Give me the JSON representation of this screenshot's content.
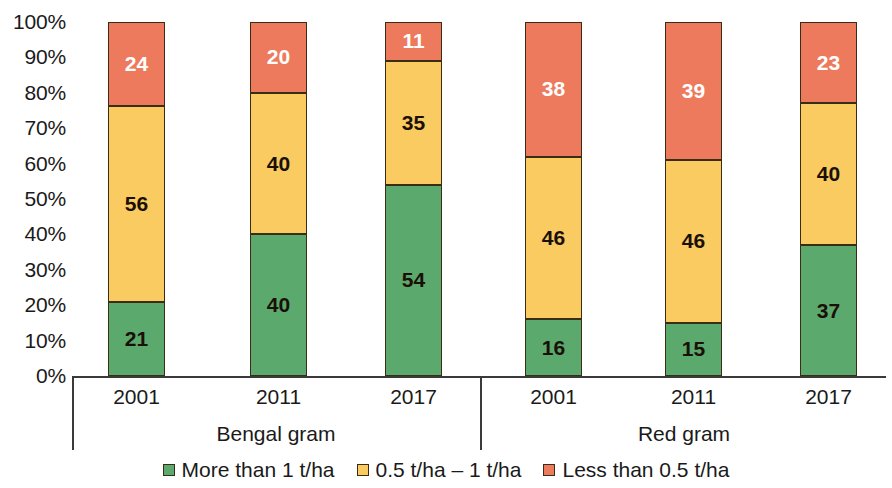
{
  "chart_data": {
    "type": "bar",
    "subtype": "stacked-percentage",
    "title": "",
    "xlabel": "",
    "ylabel": "",
    "ylim": [
      0,
      100
    ],
    "y_tick_labels": [
      "100%",
      "90%",
      "80%",
      "70%",
      "60%",
      "50%",
      "40%",
      "30%",
      "20%",
      "10%",
      "0%"
    ],
    "y_tick_values": [
      100,
      90,
      80,
      70,
      60,
      50,
      40,
      30,
      20,
      10,
      0
    ],
    "grid": false,
    "legend_position": "bottom-center",
    "categories": [
      "2001",
      "2011",
      "2017",
      "2001",
      "2011",
      "2017"
    ],
    "groups": [
      {
        "label": "Bengal gram",
        "categories": [
          "2001",
          "2011",
          "2017"
        ]
      },
      {
        "label": "Red gram",
        "categories": [
          "2001",
          "2011",
          "2017"
        ]
      }
    ],
    "series": [
      {
        "name": "More than 1 t/ha",
        "color": "#5BA96C",
        "values": [
          21,
          40,
          54,
          16,
          15,
          37
        ]
      },
      {
        "name": "0.5 t/ha – 1 t/ha",
        "color": "#F9CB60",
        "values": [
          56,
          40,
          35,
          46,
          46,
          40
        ]
      },
      {
        "name": "Less than 0.5 t/ha",
        "color": "#ED7A5C",
        "values": [
          24,
          20,
          11,
          38,
          39,
          23
        ]
      }
    ],
    "bars": [
      {
        "group": "Bengal gram",
        "category": "2001",
        "segments": [
          {
            "series": "More than 1 t/ha",
            "value": 21,
            "label": "21",
            "color": "#5BA96C",
            "text_color": "#1a1008"
          },
          {
            "series": "0.5 t/ha – 1 t/ha",
            "value": 56,
            "label": "56",
            "color": "#F9CB60",
            "text_color": "#1a1008"
          },
          {
            "series": "Less than 0.5 t/ha",
            "value": 24,
            "label": "24",
            "color": "#ED7A5C",
            "text_color": "#ffffff"
          }
        ]
      },
      {
        "group": "Bengal gram",
        "category": "2011",
        "segments": [
          {
            "series": "More than 1 t/ha",
            "value": 40,
            "label": "40",
            "color": "#5BA96C",
            "text_color": "#1a1008"
          },
          {
            "series": "0.5 t/ha – 1 t/ha",
            "value": 40,
            "label": "40",
            "color": "#F9CB60",
            "text_color": "#1a1008"
          },
          {
            "series": "Less than 0.5 t/ha",
            "value": 20,
            "label": "20",
            "color": "#ED7A5C",
            "text_color": "#ffffff"
          }
        ]
      },
      {
        "group": "Bengal gram",
        "category": "2017",
        "segments": [
          {
            "series": "More than 1 t/ha",
            "value": 54,
            "label": "54",
            "color": "#5BA96C",
            "text_color": "#1a1008"
          },
          {
            "series": "0.5 t/ha – 1 t/ha",
            "value": 35,
            "label": "35",
            "color": "#F9CB60",
            "text_color": "#1a1008"
          },
          {
            "series": "Less than 0.5 t/ha",
            "value": 11,
            "label": "11",
            "color": "#ED7A5C",
            "text_color": "#ffffff"
          }
        ]
      },
      {
        "group": "Red gram",
        "category": "2001",
        "segments": [
          {
            "series": "More than 1 t/ha",
            "value": 16,
            "label": "16",
            "color": "#5BA96C",
            "text_color": "#1a1008"
          },
          {
            "series": "0.5 t/ha – 1 t/ha",
            "value": 46,
            "label": "46",
            "color": "#F9CB60",
            "text_color": "#1a1008"
          },
          {
            "series": "Less than 0.5 t/ha",
            "value": 38,
            "label": "38",
            "color": "#ED7A5C",
            "text_color": "#ffffff"
          }
        ]
      },
      {
        "group": "Red gram",
        "category": "2011",
        "segments": [
          {
            "series": "More than 1 t/ha",
            "value": 15,
            "label": "15",
            "color": "#5BA96C",
            "text_color": "#1a1008"
          },
          {
            "series": "0.5 t/ha – 1 t/ha",
            "value": 46,
            "label": "46",
            "color": "#F9CB60",
            "text_color": "#1a1008"
          },
          {
            "series": "Less than 0.5 t/ha",
            "value": 39,
            "label": "39",
            "color": "#ED7A5C",
            "text_color": "#ffffff"
          }
        ]
      },
      {
        "group": "Red gram",
        "category": "2017",
        "segments": [
          {
            "series": "More than 1 t/ha",
            "value": 37,
            "label": "37",
            "color": "#5BA96C",
            "text_color": "#1a1008"
          },
          {
            "series": "0.5 t/ha – 1 t/ha",
            "value": 40,
            "label": "40",
            "color": "#F9CB60",
            "text_color": "#1a1008"
          },
          {
            "series": "Less than 0.5 t/ha",
            "value": 23,
            "label": "23",
            "color": "#ED7A5C",
            "text_color": "#ffffff"
          }
        ]
      }
    ],
    "legend": [
      {
        "label": "More than 1 t/ha",
        "color": "#5BA96C"
      },
      {
        "label": "0.5 t/ha – 1 t/ha",
        "color": "#F9CB60"
      },
      {
        "label": "Less than 0.5 t/ha",
        "color": "#ED7A5C"
      }
    ],
    "colors": {
      "more_than_1": "#5BA96C",
      "half_to_1": "#F9CB60",
      "less_than_half": "#ED7A5C",
      "segment_border": "#3a2d16",
      "axis": "#3a3a3a",
      "text": "#1a1a1a"
    }
  }
}
